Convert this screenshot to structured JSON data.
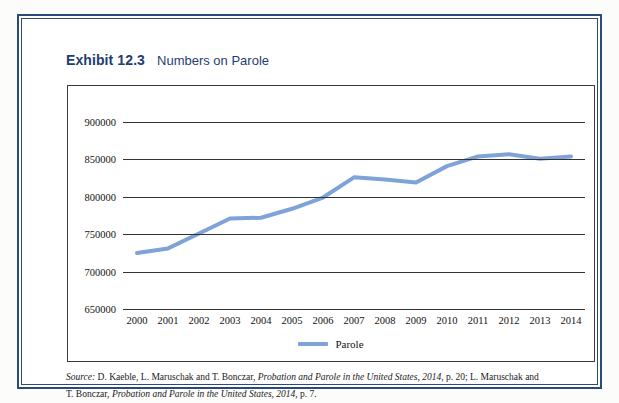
{
  "exhibit": {
    "label": "Exhibit 12.3",
    "title": "Numbers on Parole"
  },
  "source": {
    "prefix": "Source:",
    "line1_a": " D. Kaeble, L. Maruschak and T. Bonczar, ",
    "line1_italic": "Probation and Parole in the United States, 2014",
    "line1_b": ", p. 20; L. Maruschak and",
    "line2_a": "T. Bonczar, ",
    "line2_italic": "Probation and Parole in the United States, 2014",
    "line2_b": ", p. 7."
  },
  "chart_data": {
    "type": "line",
    "title": "Numbers on Parole",
    "xlabel": "",
    "ylabel": "",
    "grid": true,
    "legend_position": "bottom",
    "accent_color": "#7fa3d8",
    "ylim": [
      650000,
      900000
    ],
    "yticks": [
      650000,
      700000,
      750000,
      800000,
      850000,
      900000
    ],
    "ytick_labels": [
      "650000",
      "700000",
      "750000",
      "800000",
      "850000",
      "900000"
    ],
    "categories": [
      "2000",
      "2001",
      "2002",
      "2003",
      "2004",
      "2005",
      "2006",
      "2007",
      "2008",
      "2009",
      "2010",
      "2011",
      "2012",
      "2013",
      "2014"
    ],
    "series": [
      {
        "name": "Parole",
        "color": "#7fa3d8",
        "values": [
          725000,
          731000,
          751000,
          771000,
          772000,
          784000,
          799000,
          826000,
          823000,
          819000,
          841000,
          854000,
          857000,
          851000,
          854000
        ]
      }
    ]
  }
}
